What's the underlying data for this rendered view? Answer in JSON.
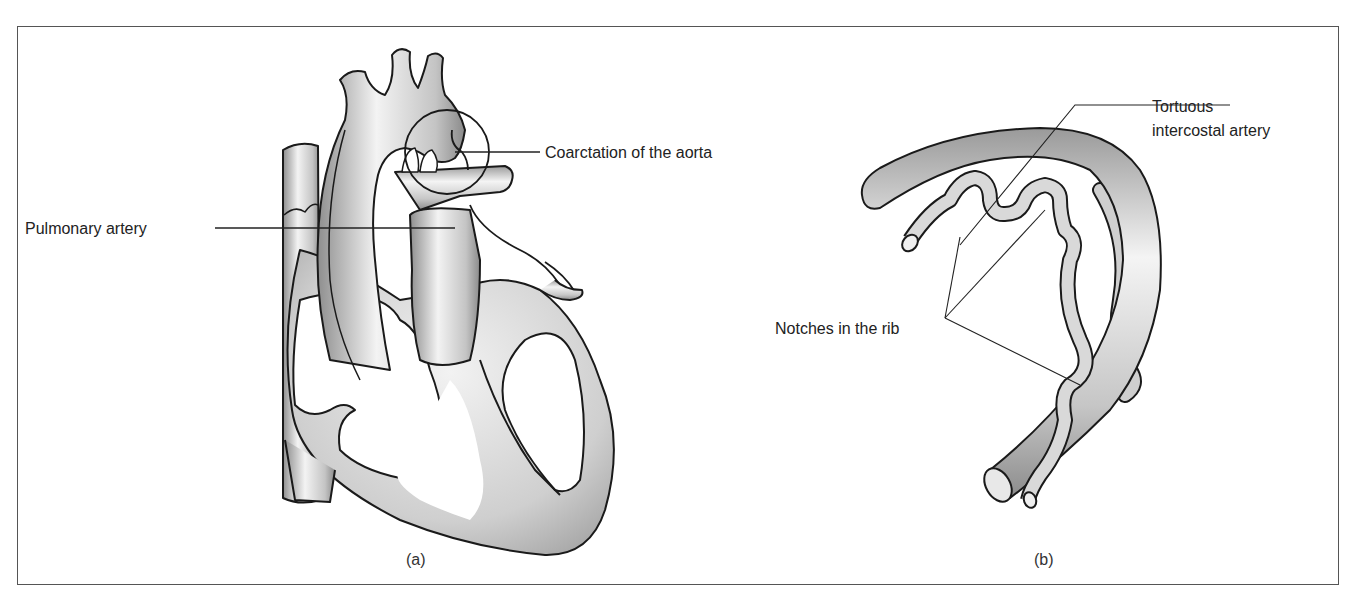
{
  "figure": {
    "panels": [
      {
        "id": "a",
        "caption": "(a)",
        "subject": "heart with coarctation of the aorta",
        "labels": {
          "pulmonary_artery": "Pulmonary artery",
          "coarctation": "Coarctation of the aorta"
        }
      },
      {
        "id": "b",
        "caption": "(b)",
        "subject": "rib with tortuous intercostal artery",
        "labels": {
          "tortuous_line1": "Tortuous",
          "tortuous_line2": "intercostal artery",
          "notches": "Notches in the rib"
        }
      }
    ],
    "colors": {
      "outline": "#1a1a1a",
      "fill_light": "#f2f2f2",
      "fill_mid": "#c8c8c8",
      "fill_dark": "#8a8a8a",
      "frame": "#555555",
      "text": "#222222"
    }
  }
}
